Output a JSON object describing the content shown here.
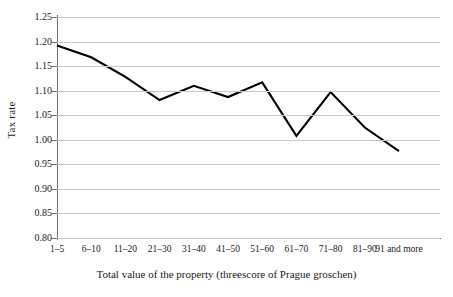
{
  "chart_data": {
    "type": "line",
    "title": "",
    "xlabel": "Total value of the property (threescore of Prague groschen)",
    "ylabel": "Tax rate",
    "categories": [
      "1–5",
      "6–10",
      "11–20",
      "21–30",
      "31–40",
      "41–50",
      "51–60",
      "61–70",
      "71–80",
      "81–90",
      "91 and more"
    ],
    "values": [
      1.192,
      1.168,
      1.128,
      1.081,
      1.11,
      1.087,
      1.117,
      1.008,
      1.097,
      1.025,
      0.977
    ],
    "series": [
      {
        "name": "Tax rate",
        "values": [
          1.192,
          1.168,
          1.128,
          1.081,
          1.11,
          1.087,
          1.117,
          1.008,
          1.097,
          1.025,
          0.977
        ],
        "color": "#000000"
      }
    ],
    "ylim": [
      0.8,
      1.25
    ],
    "yticks": [
      "0.80",
      "0.85",
      "0.90",
      "0.95",
      "1.00",
      "1.05",
      "1.10",
      "1.15",
      "1.20",
      "1.25"
    ],
    "ytick_values": [
      0.8,
      0.85,
      0.9,
      0.95,
      1.0,
      1.05,
      1.1,
      1.15,
      1.2,
      1.25
    ],
    "grid": true,
    "grid_color": "#c8c8c8",
    "axis_color": "#6e6e6e",
    "legend": "none",
    "legend_position": "none",
    "line_color": "#000000",
    "line_width": 2.1,
    "background": "#ffffff"
  }
}
